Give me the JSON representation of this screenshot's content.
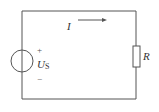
{
  "diagram": {
    "type": "circuit",
    "components": [
      {
        "kind": "voltage-source",
        "label": "U",
        "subscript": "S",
        "polarity_top": "+",
        "polarity_bottom": "−"
      },
      {
        "kind": "resistor",
        "label": "R"
      }
    ],
    "current": {
      "label": "I",
      "direction": "right"
    },
    "colors": {
      "wire": "#555555",
      "text": "#333333",
      "background": "#ffffff"
    }
  }
}
